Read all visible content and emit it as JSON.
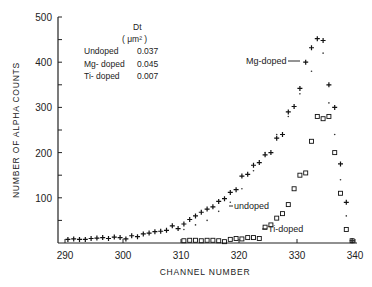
{
  "chart_data": {
    "type": "scatter",
    "title": "",
    "xlabel": "CHANNEL NUMBER",
    "ylabel": "NUMBER OF ALPHA COUNTS",
    "xlim": [
      290,
      340
    ],
    "ylim": [
      0,
      500
    ],
    "xticks": [
      290,
      300,
      310,
      320,
      330,
      340
    ],
    "yticks": [
      100,
      200,
      300,
      400,
      500
    ],
    "grid": false,
    "legend_table": {
      "header": "Dt",
      "unit": "( μm² )",
      "rows": [
        {
          "label": "Undoped",
          "value": "0.037"
        },
        {
          "label": "Mg- doped",
          "value": "0.045"
        },
        {
          "label": "Ti- doped",
          "value": "0.007"
        }
      ]
    },
    "annotations": [
      {
        "text": "Mg-doped",
        "x": 331.5,
        "y": 405
      },
      {
        "text": "undoped",
        "x": 317,
        "y": 92
      },
      {
        "text": "Ti-doped",
        "x": 324.5,
        "y": 38
      }
    ],
    "series": [
      {
        "name": "Mg-doped",
        "marker": "+",
        "x": [
          290.5,
          291.5,
          292.5,
          293.5,
          294.5,
          295.5,
          296.5,
          297.5,
          298.5,
          299.5,
          300.5,
          301.5,
          302.5,
          303.5,
          304.5,
          305.5,
          306.5,
          307.5,
          308.5,
          309.5,
          310.5,
          311.5,
          312.5,
          313.5,
          314.5,
          315.5,
          316.5,
          317.5,
          318.5,
          319.5,
          320.5,
          321.5,
          322.5,
          323.5,
          324.5,
          325.5,
          326.5,
          327.5,
          328.5,
          329.5,
          330.5,
          331.5,
          332.5,
          333.5,
          334.5,
          335.5,
          336.5,
          337.5,
          338.5,
          339.5
        ],
        "values": [
          8,
          9,
          8,
          8,
          10,
          11,
          12,
          10,
          13,
          12,
          9,
          16,
          14,
          20,
          22,
          25,
          26,
          28,
          38,
          32,
          42,
          52,
          60,
          68,
          75,
          80,
          92,
          98,
          112,
          118,
          148,
          152,
          172,
          178,
          195,
          200,
          232,
          240,
          290,
          302,
          342,
          400,
          432,
          452,
          448,
          350,
          300,
          175,
          90,
          5
        ]
      },
      {
        "name": "Undoped",
        "marker": ".",
        "x": [
          310.5,
          312.5,
          314.5,
          316.5,
          318.5,
          320.5,
          322.5,
          324.5,
          326.5,
          328.5,
          330.5,
          332.5,
          334.5,
          335.5,
          336.5,
          337.5,
          338.5,
          339.5
        ],
        "values": [
          30,
          40,
          50,
          70,
          90,
          120,
          160,
          200,
          240,
          280,
          330,
          380,
          420,
          310,
          240,
          140,
          60,
          5
        ]
      },
      {
        "name": "Ti-doped",
        "marker": "square",
        "x": [
          310.5,
          311.5,
          312.5,
          313.5,
          314.5,
          315.5,
          316.5,
          317.5,
          318.5,
          319.5,
          320.5,
          321.5,
          322.5,
          323.5,
          324.5,
          325.5,
          326.5,
          327.5,
          328.5,
          329.5,
          330.5,
          331.5,
          332.5,
          333.5,
          334.5,
          335.5,
          336.5,
          337.5,
          338.5,
          339.5
        ],
        "values": [
          5,
          6,
          6,
          5,
          6,
          6,
          5,
          3,
          8,
          10,
          9,
          12,
          12,
          10,
          35,
          40,
          55,
          65,
          85,
          120,
          150,
          155,
          225,
          280,
          275,
          280,
          200,
          110,
          30,
          5
        ]
      }
    ]
  }
}
